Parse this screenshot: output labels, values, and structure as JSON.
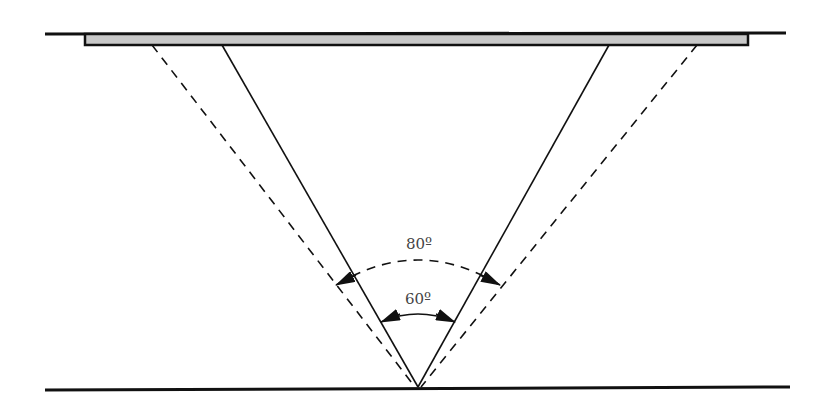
{
  "diagram": {
    "type": "beam-angle-diagram",
    "colors": {
      "line": "#111111",
      "bar_fill": "#c8c8c8",
      "label": "#444444"
    },
    "angles": [
      {
        "id": "outer",
        "label": "80º",
        "style": "dashed"
      },
      {
        "id": "inner",
        "label": "60º",
        "style": "solid"
      }
    ]
  }
}
